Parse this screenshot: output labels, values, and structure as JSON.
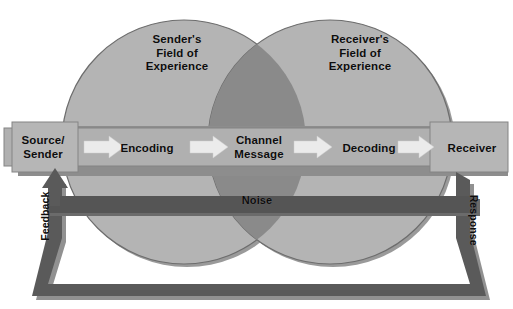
{
  "diagram": {
    "width": 513,
    "height": 309
  },
  "fields_of_experience": [
    {
      "id": "sender",
      "label": "Sender's\nField of\nExperience"
    },
    {
      "id": "receiver",
      "label": "Receiver's\nField of\nExperience"
    }
  ],
  "process_band": {
    "steps": [
      {
        "id": "source",
        "label": "Source/\nSender"
      },
      {
        "id": "encoding",
        "label": "Encoding"
      },
      {
        "id": "channel",
        "label": "Channel\nMessage"
      },
      {
        "id": "decoding",
        "label": "Decoding"
      },
      {
        "id": "receiver",
        "label": "Receiver"
      }
    ],
    "arrow_count": 4,
    "arrow_direction": "right"
  },
  "noise": {
    "label": "Noise"
  },
  "loops": [
    {
      "id": "feedback",
      "label": "Feedback",
      "direction": "up",
      "side": "left"
    },
    {
      "id": "response",
      "label": "Response",
      "direction": "down",
      "side": "right"
    }
  ],
  "colors": {
    "background": "#ffffff",
    "circle_fill": "#b4b4b4",
    "circle_stroke": "#6f6f6f",
    "overlap_fill": "#8a8a8a",
    "band_fill": "#b0b0b0",
    "band_stroke": "#7d7d7d",
    "arrow_fill": "#e8e8e8",
    "noise_fill": "#555555",
    "loop_fill": "#5a5a5a",
    "shadow": "#8d8d8d",
    "text": "#0d0d0d"
  }
}
